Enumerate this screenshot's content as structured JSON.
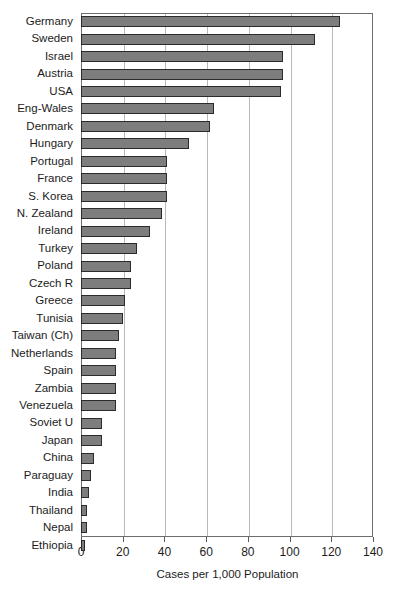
{
  "chart_data": {
    "type": "bar",
    "orientation": "horizontal",
    "title": "",
    "xlabel": "Cases per 1,000 Population",
    "ylabel": "",
    "xlim": [
      0,
      140
    ],
    "xticks": [
      0,
      20,
      40,
      60,
      80,
      100,
      120,
      140
    ],
    "grid": true,
    "legend": "none",
    "bar_color": "#7d7d7d",
    "bar_border_color": "#2b2b2b",
    "axis_color": "#6e6e6e",
    "gridline_color": "#b9b9b9",
    "categories": [
      "Germany",
      "Sweden",
      "Israel",
      "Austria",
      "USA",
      "Eng-Wales",
      "Denmark",
      "Hungary",
      "Portugal",
      "France",
      "S. Korea",
      "N. Zealand",
      "Ireland",
      "Turkey",
      "Poland",
      "Czech R",
      "Greece",
      "Tunisia",
      "Taiwan (Ch)",
      "Netherlands",
      "Spain",
      "Zambia",
      "Venezuela",
      "Soviet U",
      "Japan",
      "China",
      "Paraguay",
      "India",
      "Thailand",
      "Nepal",
      "Ethiopia"
    ],
    "values": [
      124,
      112,
      97,
      97,
      96,
      64,
      62,
      52,
      41,
      41,
      41,
      39,
      33,
      27,
      24,
      24,
      21,
      20,
      18,
      17,
      17,
      17,
      17,
      10,
      10,
      6,
      5,
      4,
      3,
      3,
      2
    ]
  }
}
